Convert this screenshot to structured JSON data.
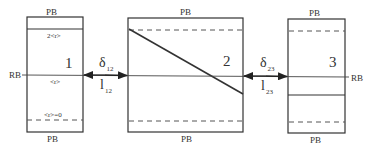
{
  "diagram": {
    "boundary_labels": {
      "periodic": "PB",
      "rigid": "RB"
    },
    "boxes": [
      {
        "id": "1",
        "label": "1",
        "top_label": "PB",
        "bottom_label": "PB",
        "annotations": {
          "upper": "2<r>",
          "middle": "<r>",
          "lower": "<r>=0"
        }
      },
      {
        "id": "2",
        "label": "2",
        "top_label": "PB",
        "bottom_label": "PB"
      },
      {
        "id": "3",
        "label": "3",
        "top_label": "PB",
        "bottom_label": "PB"
      }
    ],
    "gaps": [
      {
        "delta": "δ",
        "delta_sub": "12",
        "l": "l",
        "l_sub": "12"
      },
      {
        "delta": "δ",
        "delta_sub": "23",
        "l": "l",
        "l_sub": "23"
      }
    ],
    "colors": {
      "stroke": "#333333",
      "background": "#ffffff"
    }
  }
}
